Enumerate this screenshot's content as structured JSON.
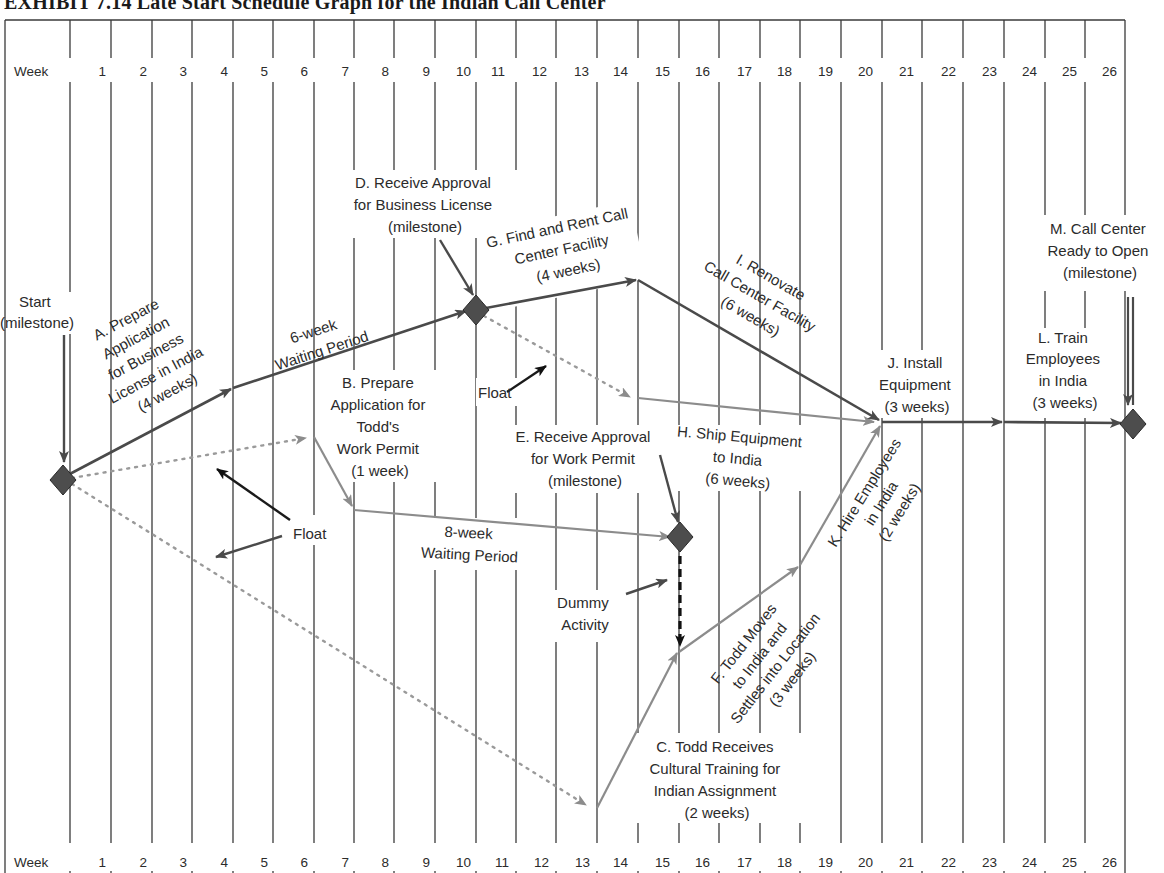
{
  "title": "EXHIBIT 7.14   Late Start Schedule Graph for the Indian Call Center",
  "header": {
    "week_label": "Week",
    "weeks": [
      "1",
      "2",
      "3",
      "4",
      "5",
      "6",
      "7",
      "8",
      "9",
      "10",
      "11",
      "12",
      "13",
      "14",
      "15",
      "16",
      "17",
      "18",
      "19",
      "20",
      "21",
      "22",
      "23",
      "24",
      "25",
      "26"
    ]
  },
  "footer": {
    "week_label": "Week"
  },
  "colors": {
    "critical": "#4a4a4a",
    "noncritical": "#8c8c8c",
    "milestone": "#4d4d4d",
    "grid": "#3a3a3a",
    "float_dotted": "#9a9a9a",
    "dummy": "#111111"
  },
  "milestones": {
    "start": [
      "Start",
      "(milestone)"
    ],
    "d": [
      "D. Receive Approval",
      "for Business License",
      "(milestone)"
    ],
    "e": [
      "E. Receive Approval",
      "for Work Permit",
      "(milestone)"
    ],
    "m": [
      "M. Call Center",
      "Ready to Open",
      "(milestone)"
    ]
  },
  "activities": {
    "a": [
      "A. Prepare",
      "Application",
      "for Business",
      "License in India",
      "(4 weeks)"
    ],
    "wait6": [
      "6-week",
      "Waiting Period"
    ],
    "b": [
      "B. Prepare",
      "Application for",
      "Todd's",
      "Work Permit",
      "(1 week)"
    ],
    "wait8": [
      "8-week",
      "Waiting Period"
    ],
    "g": [
      "G. Find and Rent Call",
      "Center Facility",
      "(4 weeks)"
    ],
    "i": [
      "I. Renovate",
      "Call Center Facility",
      "(6 weeks)"
    ],
    "h": [
      "H. Ship Equipment",
      "to India",
      "(6 weeks)"
    ],
    "c": [
      "C. Todd Receives",
      "Cultural Training for",
      "Indian Assignment",
      "(2 weeks)"
    ],
    "f": [
      "F. Todd Moves",
      "to India and",
      "Settles into Location",
      "(3 weeks)"
    ],
    "k": [
      "K. Hire Employees",
      "in India",
      "(2 weeks)"
    ],
    "j": [
      "J. Install",
      "Equipment",
      "(3 weeks)"
    ],
    "l": [
      "L. Train",
      "Employees",
      "in India",
      "(3 weeks)"
    ]
  },
  "annotations": {
    "float_1": "Float",
    "float_2": "Float",
    "dummy": [
      "Dummy",
      "Activity"
    ]
  }
}
